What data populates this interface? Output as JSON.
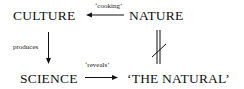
{
  "diagram": {
    "nodes": {
      "culture": "CULTURE",
      "nature": "NATURE",
      "science": "SCIENCE",
      "the_natural": "‘THE NATURAL’"
    },
    "edges": [
      {
        "from": "NATURE",
        "to": "CULTURE",
        "label": "‘cooking’",
        "type": "arrow"
      },
      {
        "from": "CULTURE",
        "to": "SCIENCE",
        "label": "produces",
        "type": "arrow"
      },
      {
        "from": "SCIENCE",
        "to": "‘THE NATURAL’",
        "label": "‘reveals’",
        "type": "arrow"
      },
      {
        "from": "NATURE",
        "to": "‘THE NATURAL’",
        "label": "",
        "type": "not-equal"
      }
    ],
    "labels": {
      "cooking": "‘cooking’",
      "produces": "produces",
      "reveals": "‘reveals’"
    },
    "colors": {
      "ink": "#111111",
      "background": "#ffffff"
    }
  }
}
